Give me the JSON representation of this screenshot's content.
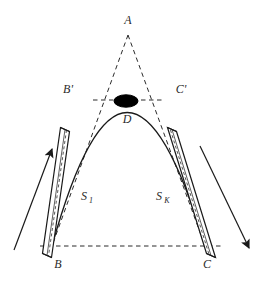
{
  "figure": {
    "type": "geometric-diagram",
    "title": "",
    "background_color": "#ffffff",
    "stroke_color": "#1a1a1a",
    "dash_color": "#2b2b2b",
    "fill_color": "#000000",
    "labels": {
      "apex": "A",
      "left_upper": "B'",
      "right_upper": "C'",
      "center_mass": "D",
      "left_base": "B",
      "right_base": "C",
      "left_side": "S",
      "left_side_sub": "1",
      "right_side": "S",
      "right_side_sub": "K"
    },
    "geometry": {
      "apex_point": [
        128,
        35
      ],
      "left_upper_point": [
        98,
        100
      ],
      "right_upper_point": [
        158,
        100
      ],
      "left_base_point": [
        52,
        246
      ],
      "right_base_point": [
        205,
        246
      ],
      "ellipse_center": [
        126,
        101
      ],
      "ellipse_rx": 12,
      "ellipse_ry": 6,
      "parabola_apex": [
        126,
        106
      ]
    },
    "arrows": {
      "left": {
        "direction": "up-right",
        "from": [
          14,
          248
        ],
        "to": [
          52,
          148
        ]
      },
      "right": {
        "direction": "down-right",
        "from": [
          201,
          146
        ],
        "to": [
          250,
          249
        ]
      }
    }
  }
}
